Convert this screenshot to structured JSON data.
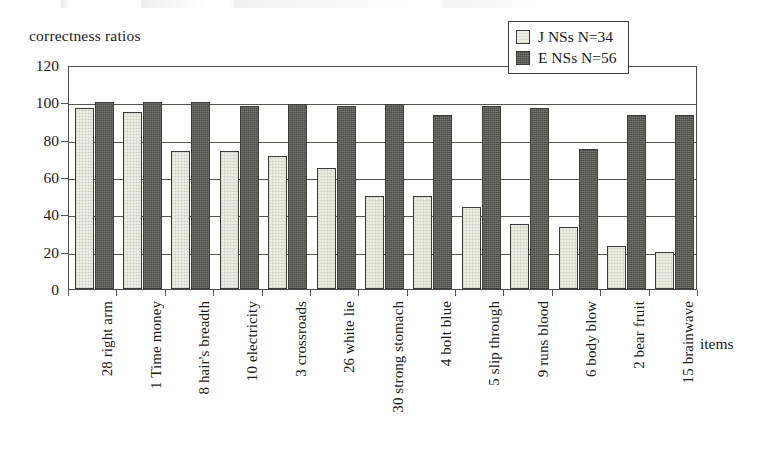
{
  "chart_data": {
    "type": "bar",
    "title": "",
    "ylabel": "correctness ratios",
    "xlabel": "items",
    "ylim": [
      0,
      120
    ],
    "yticks": [
      0,
      20,
      40,
      60,
      80,
      100,
      120
    ],
    "grid": true,
    "legend_position": "top-right",
    "categories": [
      "28 right arm",
      "1 Time money",
      "8 hair's breadth",
      "10 electricity",
      "3 crossroads",
      "26 white lie",
      "30 strong stomach",
      "4 bolt blue",
      "5 slip through",
      "9 runs blood",
      "6 body blow",
      "2 bear fruit",
      "15 brainwave"
    ],
    "series": [
      {
        "name": "J NSs N=34",
        "color": "#eceee2",
        "values": [
          97,
          95,
          74,
          74,
          71,
          65,
          50,
          50,
          44,
          35,
          33,
          23,
          20
        ]
      },
      {
        "name": "E NSs N=56",
        "color": "#4b4b48",
        "values": [
          100,
          100,
          100,
          98,
          99,
          98,
          99,
          93,
          98,
          97,
          75,
          93,
          93
        ]
      }
    ]
  },
  "legend": {
    "items": [
      {
        "label": "J NSs N=34",
        "swatch": "light"
      },
      {
        "label": "E NSs N=56",
        "swatch": "dark"
      }
    ]
  },
  "axes": {
    "y_title": "correctness ratios",
    "x_title": "items"
  }
}
